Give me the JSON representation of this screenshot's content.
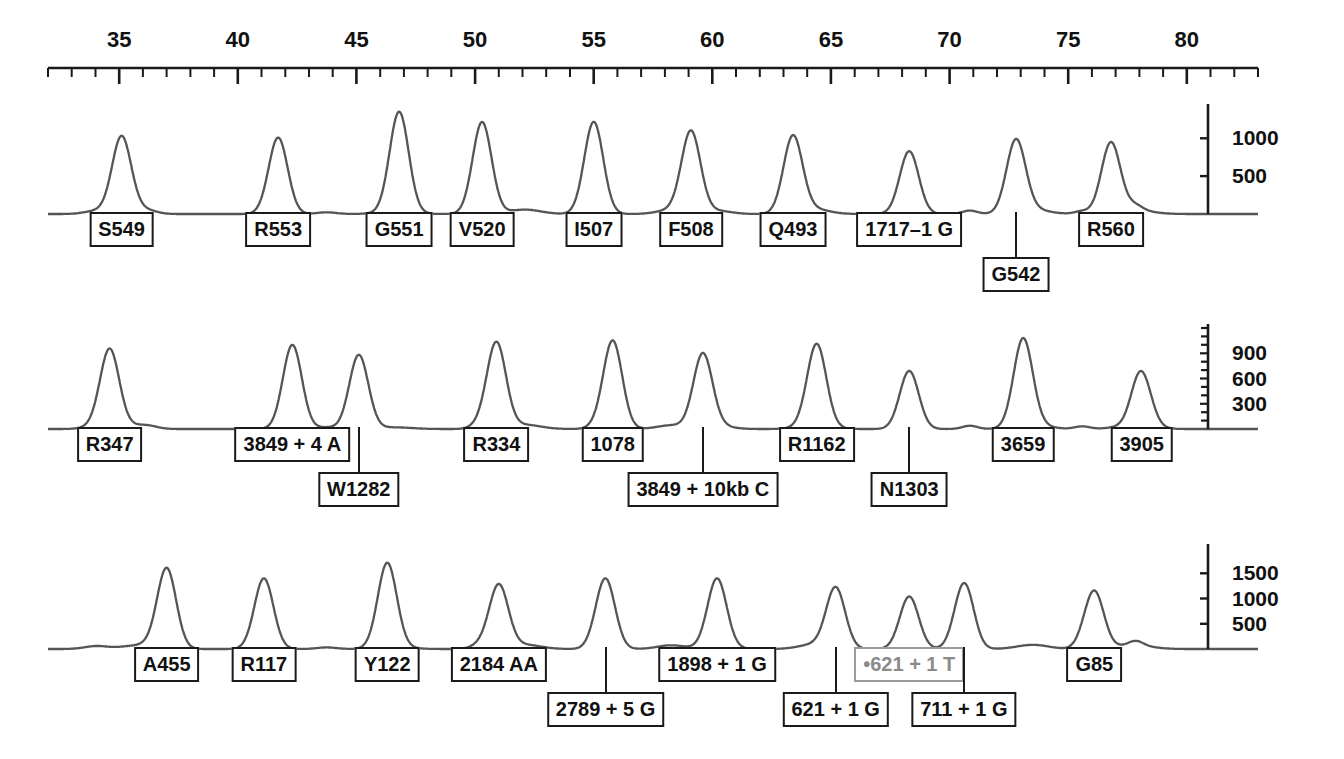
{
  "figure": {
    "type": "electropherogram"
  },
  "axis": {
    "name": "top-size-ruler",
    "tick_labels": [
      "35",
      "40",
      "45",
      "50",
      "55",
      "60",
      "65",
      "70",
      "75",
      "80"
    ],
    "tick_values": [
      35,
      40,
      45,
      50,
      55,
      60,
      65,
      70,
      75,
      80
    ],
    "minor_tick_step": 1,
    "range": [
      32,
      83
    ]
  },
  "chart_data": {
    "type": "line",
    "title": "",
    "xlabel": "",
    "ylabel": "",
    "xlim": [
      32,
      83
    ],
    "grid": false,
    "legend": "none",
    "panels": [
      {
        "name": "panel-1",
        "ylim": [
          0,
          1400
        ],
        "yticks": [
          500,
          1000
        ],
        "ytick_labels": [
          "500",
          "1000"
        ],
        "peaks": [
          {
            "label": "S549",
            "x": 35.1,
            "height": 1000,
            "box_row": 1
          },
          {
            "label": "R553",
            "x": 41.7,
            "height": 1010,
            "box_row": 1
          },
          {
            "label": "G551",
            "x": 46.8,
            "height": 1330,
            "box_row": 1
          },
          {
            "label": "V520",
            "x": 50.3,
            "height": 1160,
            "box_row": 1
          },
          {
            "label": "I507",
            "x": 55.0,
            "height": 1190,
            "box_row": 1
          },
          {
            "label": "F508",
            "x": 59.1,
            "height": 1080,
            "box_row": 1
          },
          {
            "label": "Q493",
            "x": 63.4,
            "height": 1020,
            "box_row": 1
          },
          {
            "label": "1717–1 G",
            "x": 68.3,
            "height": 830,
            "box_row": 1
          },
          {
            "label": "G542",
            "x": 72.8,
            "height": 960,
            "box_row": 2
          },
          {
            "label": "R560",
            "x": 76.8,
            "height": 930,
            "box_row": 1
          }
        ]
      },
      {
        "name": "panel-2",
        "ylim": [
          0,
          1200
        ],
        "yticks": [
          300,
          600,
          900
        ],
        "ytick_labels": [
          "300",
          "600",
          "900"
        ],
        "peaks": [
          {
            "label": "R347",
            "x": 34.6,
            "height": 930,
            "box_row": 1
          },
          {
            "label": "3849 + 4 A",
            "x": 42.3,
            "height": 1000,
            "box_row": 1
          },
          {
            "label": "W1282",
            "x": 45.1,
            "height": 880,
            "box_row": 2
          },
          {
            "label": "R334",
            "x": 50.9,
            "height": 1020,
            "box_row": 1
          },
          {
            "label": "1078",
            "x": 55.8,
            "height": 1050,
            "box_row": 1
          },
          {
            "label": "3849 + 10kb C",
            "x": 59.6,
            "height": 880,
            "box_row": 2
          },
          {
            "label": "R1162",
            "x": 64.4,
            "height": 960,
            "box_row": 1
          },
          {
            "label": "N1303",
            "x": 68.3,
            "height": 690,
            "box_row": 2
          },
          {
            "label": "3659",
            "x": 73.1,
            "height": 1040,
            "box_row": 1
          },
          {
            "label": "3905",
            "x": 78.1,
            "height": 610,
            "box_row": 1
          }
        ]
      },
      {
        "name": "panel-3",
        "ylim": [
          0,
          2000
        ],
        "yticks": [
          500,
          1000,
          1500
        ],
        "ytick_labels": [
          "500",
          "1000",
          "1500"
        ],
        "peaks": [
          {
            "label": "A455",
            "x": 37.0,
            "height": 1600,
            "box_row": 1
          },
          {
            "label": "R117",
            "x": 41.1,
            "height": 1400,
            "box_row": 1
          },
          {
            "label": "Y122",
            "x": 46.3,
            "height": 1680,
            "box_row": 1
          },
          {
            "label": "2184 AA",
            "x": 51.0,
            "height": 1260,
            "box_row": 1
          },
          {
            "label": "2789 + 5 G",
            "x": 55.5,
            "height": 1380,
            "box_row": 2
          },
          {
            "label": "1898 + 1 G",
            "x": 60.2,
            "height": 1340,
            "box_row": 1
          },
          {
            "label": "621 + 1 G",
            "x": 65.2,
            "height": 1200,
            "box_row": 2
          },
          {
            "label": "•621 + 1 T",
            "x": 68.3,
            "height": 1040,
            "box_row": 1,
            "style": "gray"
          },
          {
            "label": "711 + 1 G",
            "x": 70.6,
            "height": 1260,
            "box_row": 2
          },
          {
            "label": "G85",
            "x": 76.1,
            "height": 1140,
            "box_row": 1
          }
        ]
      }
    ]
  },
  "colors": {
    "trace": "#555555",
    "ink": "#1a1a1a",
    "gray_box": "#9b9b9b",
    "gray_text": "#8a8a8a",
    "background": "#ffffff"
  }
}
